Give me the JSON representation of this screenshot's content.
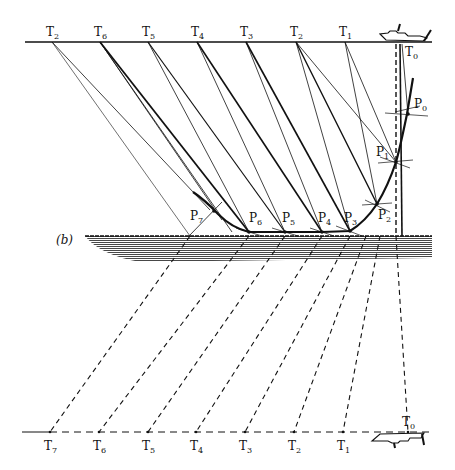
{
  "figure": {
    "panel_label": "(b)"
  },
  "top_surface": {
    "y": 42,
    "x_start": 25,
    "x_end": 432,
    "stations": [
      {
        "label": "T",
        "sub": "2",
        "x": 52
      },
      {
        "label": "T",
        "sub": "6",
        "x": 100
      },
      {
        "label": "T",
        "sub": "5",
        "x": 148
      },
      {
        "label": "T",
        "sub": "4",
        "x": 197
      },
      {
        "label": "T",
        "sub": "3",
        "x": 246
      },
      {
        "label": "T",
        "sub": "2",
        "x": 296
      },
      {
        "label": "T",
        "sub": "1",
        "x": 345
      }
    ],
    "ship_label": {
      "label": "T",
      "sub": "0",
      "x": 408
    }
  },
  "reflection_points": [
    {
      "label": "P",
      "sub": "0",
      "x": 408,
      "y": 114
    },
    {
      "label": "P",
      "sub": "1",
      "x": 396,
      "y": 162
    },
    {
      "label": "P",
      "sub": "2",
      "x": 377,
      "y": 204
    },
    {
      "label": "P",
      "sub": "3",
      "x": 350,
      "y": 231
    },
    {
      "label": "P",
      "sub": "4",
      "x": 322,
      "y": 232
    },
    {
      "label": "P",
      "sub": "5",
      "x": 285,
      "y": 232
    },
    {
      "label": "P",
      "sub": "6",
      "x": 249,
      "y": 232
    },
    {
      "label": "P",
      "sub": "7",
      "x": 214,
      "y": 212
    }
  ],
  "seabed": {
    "y": 236,
    "x_start": 85,
    "x_end": 432
  },
  "bottom_surface": {
    "y": 432,
    "stations": [
      {
        "label": "T",
        "sub": "7",
        "x": 50
      },
      {
        "label": "T",
        "sub": "6",
        "x": 99
      },
      {
        "label": "T",
        "sub": "5",
        "x": 148
      },
      {
        "label": "T",
        "sub": "4",
        "x": 196
      },
      {
        "label": "T",
        "sub": "3",
        "x": 245
      },
      {
        "label": "T",
        "sub": "2",
        "x": 294
      },
      {
        "label": "T",
        "sub": "1",
        "x": 343
      }
    ],
    "ship_label": {
      "label": "T",
      "sub": "0",
      "x": 408
    }
  },
  "colors": {
    "ink": "#111111",
    "background": "#ffffff"
  }
}
